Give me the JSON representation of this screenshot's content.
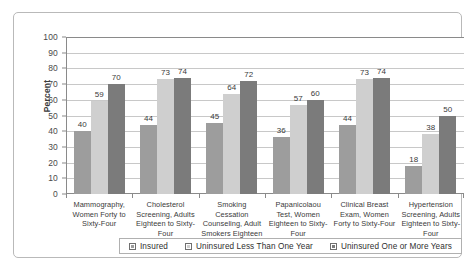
{
  "chart_data": {
    "type": "bar",
    "title": "",
    "xlabel": "",
    "ylabel": "Percent",
    "ylim": [
      0,
      100
    ],
    "yticks": [
      0,
      10,
      20,
      30,
      40,
      50,
      60,
      70,
      80,
      90,
      100
    ],
    "grid": true,
    "legend_position": "bottom",
    "categories": [
      "Mammography, Women Forty to Sixty-Four",
      "Cholesterol Screening, Adults Eighteen to Sixty-Four",
      "Smoking Cessation Counseling, Adult Smokers Eighteen to Sixty-Four",
      "Papanicolaou Test, Women Eighteen to Sixty-Four",
      "Clinical Breast Exam, Women Forty to Sixty-Four",
      "Hypertension Screening, Adults Eighteen to Sixty-Four"
    ],
    "series": [
      {
        "name": "Insured",
        "color": "#9d9d9d",
        "values": [
          40,
          44,
          45,
          36,
          44,
          18
        ]
      },
      {
        "name": "Uninsured Less Than One Year",
        "color": "#cfcfcf",
        "values": [
          59,
          73,
          64,
          57,
          73,
          38
        ]
      },
      {
        "name": "Uninsured One or More Years",
        "color": "#7b7b7b",
        "values": [
          70,
          74,
          72,
          60,
          74,
          50
        ]
      }
    ]
  }
}
